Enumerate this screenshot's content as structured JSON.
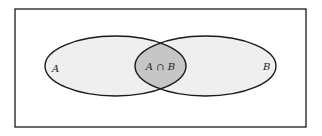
{
  "diagram": {
    "type": "venn",
    "universe": {
      "x": 15,
      "y": 9,
      "width": 291,
      "height": 118
    },
    "sets": [
      {
        "id": "A",
        "label": "A",
        "cx": 115.5,
        "cy": 66,
        "rx": 70.5,
        "ry": 30,
        "fill": "#efefef"
      },
      {
        "id": "B",
        "label": "B",
        "cx": 205.5,
        "cy": 66,
        "rx": 70.5,
        "ry": 30,
        "fill": "#efefef"
      }
    ],
    "intersection": {
      "label": "A ∩ B",
      "fill": "#c6c6c6"
    },
    "colors": {
      "stroke": "#1a1a1a",
      "background": "#ffffff"
    }
  }
}
